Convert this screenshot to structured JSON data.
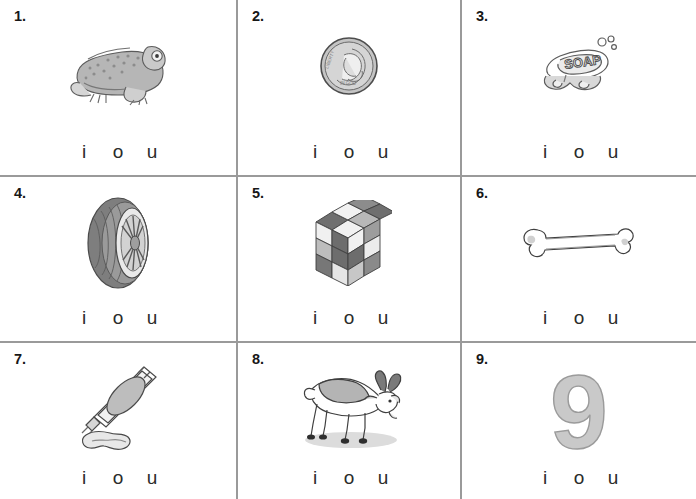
{
  "worksheet": {
    "title": "Short vowel sound worksheet",
    "columns": 3,
    "rows": 3,
    "choice_letters": [
      "i",
      "o",
      "u"
    ],
    "line_color": "#9a9a9a",
    "text_color": "#1a1a1a",
    "art_color": "#7d7d7d"
  },
  "items": [
    {
      "number": "1.",
      "icon": "frog-icon",
      "picture_label": "frog",
      "choices": [
        "i",
        "o",
        "u"
      ]
    },
    {
      "number": "2.",
      "icon": "dime-coin-icon",
      "picture_label": "dime",
      "choices": [
        "i",
        "o",
        "u"
      ]
    },
    {
      "number": "3.",
      "icon": "soap-bar-icon",
      "picture_label": "soap",
      "picture_text": "SOAP",
      "choices": [
        "i",
        "o",
        "u"
      ]
    },
    {
      "number": "4.",
      "icon": "tire-icon",
      "picture_label": "tire",
      "choices": [
        "i",
        "o",
        "u"
      ]
    },
    {
      "number": "5.",
      "icon": "cube-icon",
      "picture_label": "cube",
      "choices": [
        "i",
        "o",
        "u"
      ]
    },
    {
      "number": "6.",
      "icon": "bone-icon",
      "picture_label": "bone",
      "choices": [
        "i",
        "o",
        "u"
      ]
    },
    {
      "number": "7.",
      "icon": "toothpaste-tube-icon",
      "picture_label": "tube",
      "choices": [
        "i",
        "o",
        "u"
      ]
    },
    {
      "number": "8.",
      "icon": "goat-icon",
      "picture_label": "goat",
      "choices": [
        "i",
        "o",
        "u"
      ]
    },
    {
      "number": "9.",
      "icon": "numeral-nine-icon",
      "picture_label": "nine",
      "picture_text": "9",
      "choices": [
        "i",
        "o",
        "u"
      ]
    }
  ]
}
